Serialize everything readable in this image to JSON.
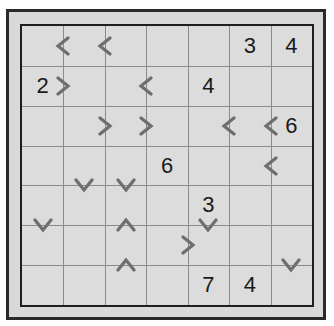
{
  "puzzle": {
    "rows": 7,
    "cols": 7,
    "colors": {
      "frame_bg": "#d9d9d9",
      "border": "#1e1e1e",
      "gridline": "#8a8a8a",
      "arrow": "#6e6e6e",
      "number": "#1a1a1a"
    },
    "numbers": [
      {
        "row": 0,
        "col": 5,
        "value": "3"
      },
      {
        "row": 0,
        "col": 6,
        "value": "4"
      },
      {
        "row": 1,
        "col": 0,
        "value": "2"
      },
      {
        "row": 1,
        "col": 4,
        "value": "4"
      },
      {
        "row": 2,
        "col": 6,
        "value": "6"
      },
      {
        "row": 3,
        "col": 3,
        "value": "6"
      },
      {
        "row": 4,
        "col": 4,
        "value": "3"
      },
      {
        "row": 6,
        "col": 4,
        "value": "7"
      },
      {
        "row": 6,
        "col": 5,
        "value": "4"
      }
    ],
    "arrows": [
      {
        "type": "left",
        "row": 0,
        "vborder": 1
      },
      {
        "type": "left",
        "row": 0,
        "vborder": 2
      },
      {
        "type": "right",
        "row": 1,
        "vborder": 1
      },
      {
        "type": "left",
        "row": 1,
        "vborder": 3
      },
      {
        "type": "right",
        "row": 2,
        "vborder": 2
      },
      {
        "type": "right",
        "row": 2,
        "vborder": 3
      },
      {
        "type": "left",
        "row": 2,
        "vborder": 5
      },
      {
        "type": "left",
        "row": 2,
        "vborder": 6
      },
      {
        "type": "left",
        "row": 3,
        "vborder": 6
      },
      {
        "type": "right",
        "row": 5,
        "vborder": 4
      },
      {
        "type": "down",
        "col": 1,
        "hborder": 4
      },
      {
        "type": "down",
        "col": 2,
        "hborder": 4
      },
      {
        "type": "down",
        "col": 0,
        "hborder": 5
      },
      {
        "type": "up",
        "col": 2,
        "hborder": 5
      },
      {
        "type": "down",
        "col": 4,
        "hborder": 5
      },
      {
        "type": "up",
        "col": 2,
        "hborder": 6
      },
      {
        "type": "down",
        "col": 6,
        "hborder": 6
      }
    ]
  }
}
